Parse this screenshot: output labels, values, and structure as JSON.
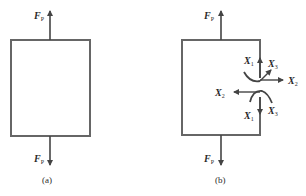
{
  "figure": {
    "panels": [
      {
        "id": "a",
        "caption": "(a)",
        "top_force": {
          "symbol": "F",
          "subscript": "P"
        },
        "bottom_force": {
          "symbol": "F",
          "subscript": "P"
        }
      },
      {
        "id": "b",
        "caption": "(b)",
        "top_force": {
          "symbol": "F",
          "subscript": "P"
        },
        "bottom_force": {
          "symbol": "F",
          "subscript": "P"
        },
        "cut_forces": {
          "upper": [
            {
              "symbol": "X",
              "subscript": "1"
            },
            {
              "symbol": "X",
              "subscript": "3"
            },
            {
              "symbol": "X",
              "subscript": "2"
            }
          ],
          "lower": [
            {
              "symbol": "X",
              "subscript": "2"
            },
            {
              "symbol": "X",
              "subscript": "1"
            },
            {
              "symbol": "X",
              "subscript": "3"
            }
          ]
        }
      }
    ],
    "colors": {
      "line": "#555555",
      "text": "#2a2a2a",
      "background": "#ffffff"
    }
  }
}
